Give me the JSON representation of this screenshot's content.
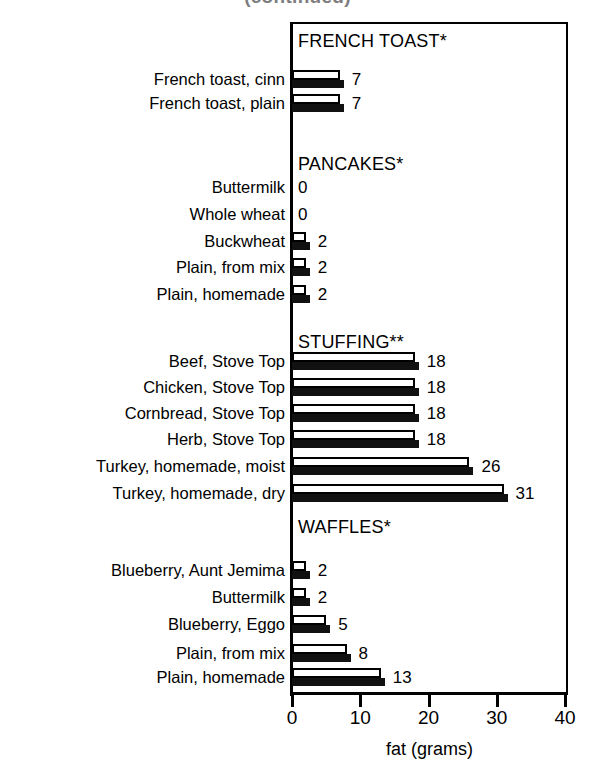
{
  "chart_data": {
    "type": "bar",
    "title": "(continued)",
    "xlabel": "fat (grams)",
    "ylabel": "",
    "xlim": [
      0,
      40
    ],
    "xticks": [
      0,
      10,
      20,
      30,
      40
    ],
    "xtick_labels": [
      "0",
      "10",
      "20",
      "30",
      "40"
    ],
    "grid": false,
    "legend": "none",
    "orientation": "horizontal",
    "sections": [
      {
        "header": "FRENCH TOAST*",
        "items": [
          {
            "label": "French toast, cinn",
            "value": 7,
            "value_label": "7"
          },
          {
            "label": "French toast, plain",
            "value": 7,
            "value_label": "7"
          }
        ]
      },
      {
        "header": "PANCAKES*",
        "items": [
          {
            "label": "Buttermilk",
            "value": 0,
            "value_label": "0"
          },
          {
            "label": "Whole wheat",
            "value": 0,
            "value_label": "0"
          },
          {
            "label": "Buckwheat",
            "value": 2,
            "value_label": "2"
          },
          {
            "label": "Plain, from mix",
            "value": 2,
            "value_label": "2"
          },
          {
            "label": "Plain, homemade",
            "value": 2,
            "value_label": "2"
          }
        ]
      },
      {
        "header": "STUFFING**",
        "items": [
          {
            "label": "Beef, Stove Top",
            "value": 18,
            "value_label": "18"
          },
          {
            "label": "Chicken, Stove Top",
            "value": 18,
            "value_label": "18"
          },
          {
            "label": "Cornbread, Stove Top",
            "value": 18,
            "value_label": "18"
          },
          {
            "label": "Herb, Stove Top",
            "value": 18,
            "value_label": "18"
          },
          {
            "label": "Turkey, homemade, moist",
            "value": 26,
            "value_label": "26"
          },
          {
            "label": "Turkey, homemade, dry",
            "value": 31,
            "value_label": "31"
          }
        ]
      },
      {
        "header": "WAFFLES*",
        "items": [
          {
            "label": "Blueberry, Aunt Jemima",
            "value": 2,
            "value_label": "2"
          },
          {
            "label": "Buttermilk",
            "value": 2,
            "value_label": "2"
          },
          {
            "label": "Blueberry, Eggo",
            "value": 5,
            "value_label": "5"
          },
          {
            "label": "Plain, from mix",
            "value": 8,
            "value_label": "8"
          },
          {
            "label": "Plain, homemade",
            "value": 13,
            "value_label": "13"
          }
        ]
      }
    ],
    "categories": [
      "French toast, cinn",
      "French toast, plain",
      "Buttermilk",
      "Whole wheat",
      "Buckwheat",
      "Plain, from mix",
      "Plain, homemade",
      "Beef, Stove Top",
      "Chicken, Stove Top",
      "Cornbread, Stove Top",
      "Herb, Stove Top",
      "Turkey, homemade, moist",
      "Turkey, homemade, dry",
      "Blueberry, Aunt Jemima",
      "Buttermilk",
      "Blueberry, Eggo",
      "Plain, from mix",
      "Plain, homemade"
    ],
    "values": [
      7,
      7,
      0,
      0,
      2,
      2,
      2,
      18,
      18,
      18,
      18,
      26,
      31,
      2,
      2,
      5,
      8,
      13
    ]
  },
  "colors": {
    "bar_white": "#ffffff",
    "bar_black": "#111111",
    "axis": "#000000",
    "background": "#ffffff"
  }
}
